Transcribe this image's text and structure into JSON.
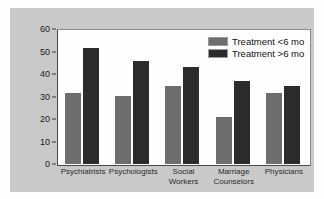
{
  "chart_data": {
    "type": "bar",
    "title": "",
    "subtitle": "",
    "xlabel": "",
    "ylabel": "",
    "ylim": [
      0,
      60
    ],
    "yticks": [
      0,
      10,
      20,
      30,
      40,
      50,
      60
    ],
    "ytick_labels": [
      "0",
      "10",
      "20",
      "30",
      "40",
      "50",
      "60"
    ],
    "grid": false,
    "legend_position": "top-right",
    "categories": [
      "Psychiatrists",
      "Psychologists",
      "Social\nWorkers",
      "Marriage\nCounselors",
      "Physicians"
    ],
    "series": [
      {
        "name": "Treatment <6 mo",
        "color": "#6e6e6e",
        "values": [
          32,
          30.5,
          35,
          21,
          32
        ]
      },
      {
        "name": "Treatment >6 mo",
        "color": "#2b2b2b",
        "values": [
          52,
          46,
          43.5,
          37,
          35
        ]
      }
    ]
  },
  "figure": {
    "panel_background": "#c9c9c9",
    "plot_background": "#fefefe",
    "axis_color": "#3a3a3a"
  }
}
